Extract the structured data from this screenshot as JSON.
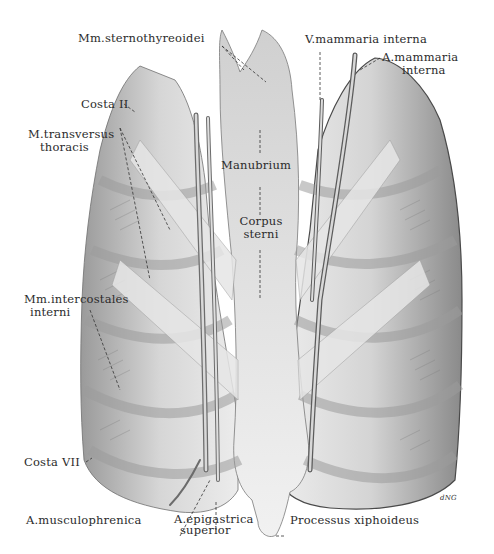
{
  "figure": {
    "signature": "dNG"
  },
  "labels": {
    "sternothyreoidei": "Mm.sternothyreoidei",
    "v_mammaria_interna": "V.mammaria interna",
    "a_mammaria_interna_1": "A.mammaria",
    "a_mammaria_interna_2": "interna",
    "costa_ii": "Costa II",
    "transversus_1": "M.transversus",
    "transversus_2": "thoracis",
    "manubrium": "Manubrium",
    "corpus_1": "Corpus",
    "corpus_2": "sterni",
    "intercostales_1": "Mm.intercostales",
    "intercostales_2": "interni",
    "costa_vii": "Costa VII",
    "musculophrenica": "A.musculophrenica",
    "epigastrica_1": "A.epigastrica",
    "epigastrica_2": "superior",
    "xiphoideus": "Processus xiphoideus"
  },
  "colors": {
    "background": "#ffffff",
    "tissue_light": "#e9e9e9",
    "tissue_mid": "#c4c4c4",
    "tissue_dark": "#8f8f8f",
    "ink": "#2b2b2b"
  }
}
